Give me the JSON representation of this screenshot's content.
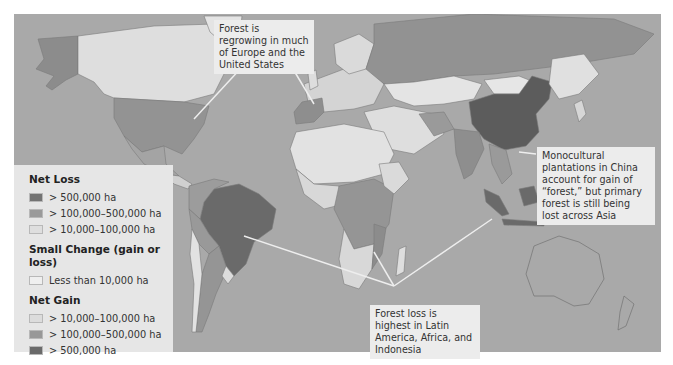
{
  "map": {
    "colors": {
      "ocean": "#a9a9a9",
      "loss_high": "#6e6e6e",
      "loss_mid": "#959595",
      "loss_low": "#d8d8d8",
      "small_change": "#e8e8e8",
      "gain_low": "#d6d6d6",
      "gain_mid": "#939393",
      "gain_high": "#5c5c5c",
      "border": "#7a7a7a"
    }
  },
  "legend": {
    "net_loss": {
      "title": "Net Loss",
      "items": [
        {
          "label": "> 500,000 ha",
          "color": "#737373"
        },
        {
          "label": "> 100,000–500,000 ha",
          "color": "#9a9a9a"
        },
        {
          "label": "> 10,000–100,000 ha",
          "color": "#dedede"
        }
      ]
    },
    "small_change": {
      "title": "Small Change (gain or loss)",
      "items": [
        {
          "label": "Less than 10,000 ha",
          "color": "#efefef"
        }
      ]
    },
    "net_gain": {
      "title": "Net Gain",
      "items": [
        {
          "label": "> 10,000–100,000 ha",
          "color": "#dcdcdc"
        },
        {
          "label": "> 100,000–500,000 ha",
          "color": "#989898"
        },
        {
          "label": "> 500,000 ha",
          "color": "#6a6a6a"
        }
      ]
    }
  },
  "callouts": {
    "europe_us": "Forest is regrowing in much of Europe and the United States",
    "china_asia": "Monocultural plantations in China account for gain of “forest,” but primary forest is still being lost across Asia",
    "tropics": "Forest loss is highest in Latin America, Africa, and Indonesia"
  }
}
